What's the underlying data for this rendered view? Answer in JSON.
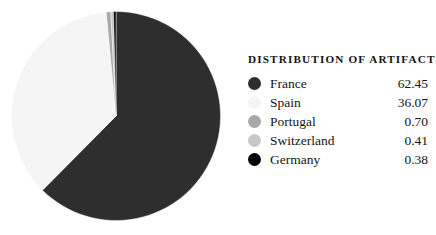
{
  "legend": {
    "title": "DISTRIBUTION OF ARTIFACTS"
  },
  "chart_data": {
    "type": "pie",
    "title": "DISTRIBUTION OF ARTIFACTS",
    "xlabel": "",
    "ylabel": "",
    "unit": "percent",
    "start_angle_deg": 0,
    "direction": "clockwise",
    "legend_position": "right",
    "grid": false,
    "labels": [
      "France",
      "Spain",
      "Portugal",
      "Switzerland",
      "Germany"
    ],
    "values": [
      62.45,
      36.07,
      0.7,
      0.41,
      0.38
    ],
    "value_labels": [
      "62.45",
      "36.07",
      "0.70",
      "0.41",
      "0.38"
    ],
    "colors": [
      "#2e2e2e",
      "#f5f5f5",
      "#a8a8a8",
      "#c8c8c8",
      "#000000"
    ],
    "slices": [
      {
        "label": "France",
        "value": 62.45,
        "value_label": "62.45",
        "color": "#2e2e2e",
        "marker": "circle-dark-gray"
      },
      {
        "label": "Spain",
        "value": 36.07,
        "value_label": "36.07",
        "color": "#f5f5f5",
        "marker": "circle-near-white"
      },
      {
        "label": "Portugal",
        "value": 0.7,
        "value_label": "0.70",
        "color": "#a8a8a8",
        "marker": "circle-medium-gray"
      },
      {
        "label": "Switzerland",
        "value": 0.41,
        "value_label": "0.41",
        "color": "#c8c8c8",
        "marker": "circle-light-gray"
      },
      {
        "label": "Germany",
        "value": 0.38,
        "value_label": "0.38",
        "color": "#000000",
        "marker": "circle-black"
      }
    ],
    "background": "#ffffff"
  }
}
